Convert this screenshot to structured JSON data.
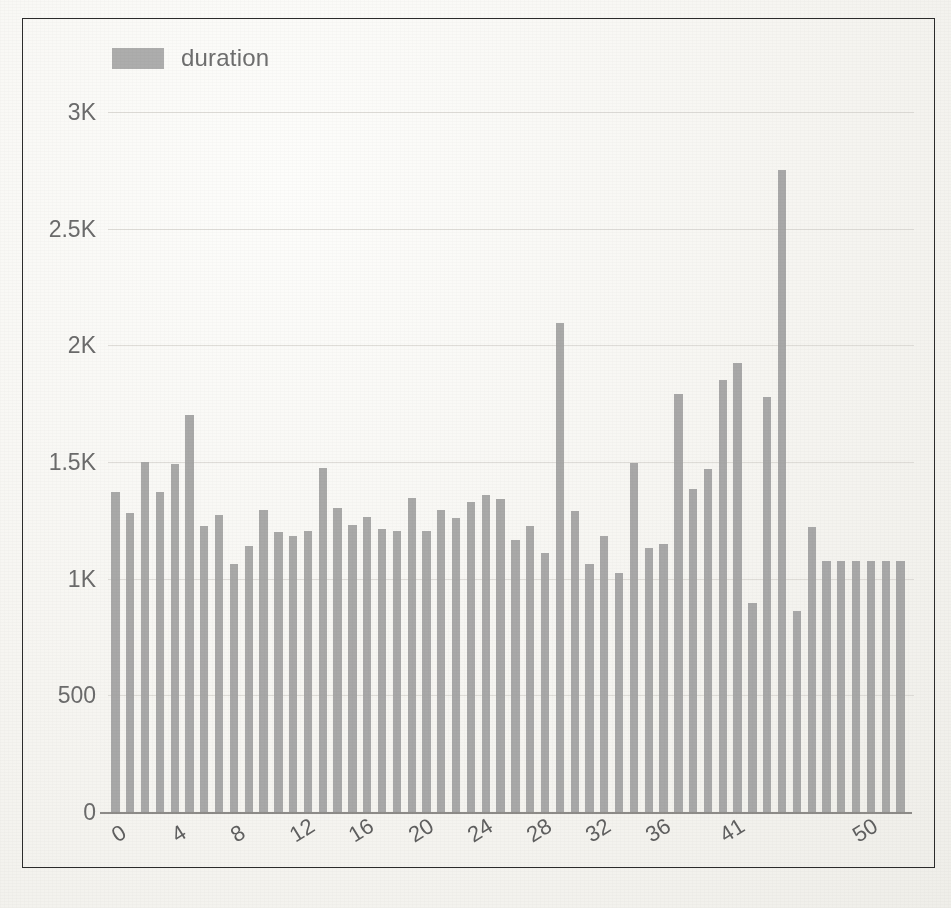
{
  "figure": {
    "frame_border_color": "#2b2b2b",
    "background_color": "#f7f6f3",
    "caption": ""
  },
  "legend": {
    "position": "top-left",
    "swatch_color": "#a2a2a2",
    "label": "duration"
  },
  "axes": {
    "y_tick_labels": [
      "0",
      "500",
      "1K",
      "1.5K",
      "2K",
      "2.5K",
      "3K"
    ],
    "y_tick_values": [
      0,
      500,
      1000,
      1500,
      2000,
      2500,
      3000
    ],
    "x_tick_labels": [
      "0",
      "4",
      "8",
      "12",
      "16",
      "20",
      "24",
      "28",
      "32",
      "36",
      "41",
      "50"
    ],
    "x_tick_indices": [
      0,
      4,
      8,
      12,
      16,
      20,
      24,
      28,
      32,
      36,
      41,
      50
    ],
    "gridline_color": "#d9d7d2",
    "baseline_color": "#8d8b88",
    "tick_text_color": "#6b6b6b"
  },
  "chart_data": {
    "type": "bar",
    "title": "",
    "subtitle": "",
    "xlabel": "",
    "ylabel": "",
    "ylim": [
      0,
      3000
    ],
    "grid": true,
    "legend_position": "top-left",
    "series_name": "duration",
    "bar_color": "#a0a0a0",
    "categories": [
      "0",
      "1",
      "2",
      "3",
      "4",
      "5",
      "6",
      "7",
      "8",
      "9",
      "10",
      "11",
      "12",
      "13",
      "14",
      "15",
      "16",
      "17",
      "18",
      "19",
      "20",
      "21",
      "22",
      "23",
      "24",
      "25",
      "26",
      "27",
      "28",
      "29",
      "30",
      "31",
      "32",
      "33",
      "34",
      "35",
      "36",
      "37",
      "38",
      "39",
      "40",
      "41",
      "42",
      "43",
      "44",
      "45",
      "46",
      "47",
      "48",
      "49",
      "50",
      "51",
      "52",
      "53"
    ],
    "values": [
      1370,
      1280,
      1500,
      1370,
      1490,
      1700,
      1225,
      1275,
      1065,
      1140,
      1295,
      1200,
      1185,
      1205,
      1475,
      1305,
      1230,
      1265,
      1215,
      1205,
      1345,
      1205,
      1295,
      1260,
      1330,
      1360,
      1340,
      1165,
      1225,
      1110,
      2095,
      1290,
      1065,
      1185,
      1025,
      1495,
      1130,
      1150,
      1790,
      1385,
      1470,
      1850,
      1925,
      895,
      1780,
      2750,
      860,
      1220,
      1075,
      1075,
      1075,
      1075,
      1075,
      1075
    ],
    "bar_count": 54,
    "notes": {
      "max_value": 2750,
      "max_index": 45,
      "second_peak_value": 2095,
      "second_peak_index": 30,
      "min_value": 860,
      "min_index": 46,
      "typical_range": [
        1000,
        1500
      ]
    }
  }
}
